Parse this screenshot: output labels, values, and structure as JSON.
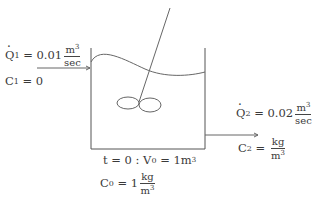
{
  "inlet": {
    "flow_symbol": "Q",
    "flow_sub": "1",
    "flow_eq": " = 0.01",
    "flow_unit_num": "m",
    "flow_unit_num_sup": "3",
    "flow_unit_den": "sec",
    "conc_symbol": "C",
    "conc_sub": "1",
    "conc_eq": " = 0"
  },
  "outlet": {
    "flow_symbol": "Q",
    "flow_sub": "2",
    "flow_eq": " = 0.02",
    "flow_unit_num": "m",
    "flow_unit_num_sup": "3",
    "flow_unit_den": "sec",
    "conc_symbol": "C",
    "conc_sub": "2",
    "conc_eq": " = ",
    "conc_unit_num": "kg",
    "conc_unit_den": "m",
    "conc_unit_den_sup": "3"
  },
  "initial": {
    "time_text": "t = 0 : V",
    "vol_sub": "0",
    "vol_eq": " = 1m",
    "vol_sup": "3",
    "conc_symbol": "C",
    "conc_sub": "0",
    "conc_eq": " = 1",
    "conc_unit_num": "kg",
    "conc_unit_den": "m",
    "conc_unit_den_sup": "3"
  },
  "colors": {
    "stroke": "#555555",
    "text": "#3a3a3a"
  }
}
